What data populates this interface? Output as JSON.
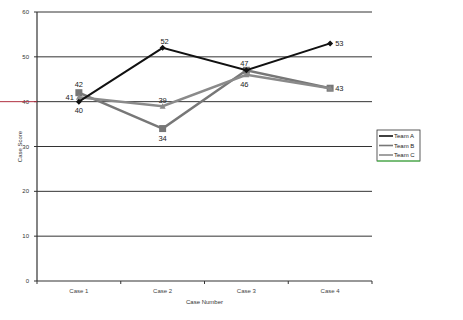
{
  "chart_data": {
    "type": "line",
    "title": "",
    "xlabel": "Case Number",
    "ylabel": "Case Score",
    "categories": [
      "Case 1",
      "Case 2",
      "Case 3",
      "Case 4"
    ],
    "ylim": [
      0,
      60
    ],
    "yticks": [
      0,
      10,
      20,
      30,
      40,
      50,
      60
    ],
    "grid": true,
    "legend_position": "right",
    "series": [
      {
        "name": "Team A",
        "values": [
          40,
          52,
          47,
          53
        ],
        "color": "#111111",
        "marker": "diamond"
      },
      {
        "name": "Team B",
        "values": [
          42,
          34,
          47,
          43
        ],
        "color": "#777777",
        "marker": "square"
      },
      {
        "name": "Team C",
        "values": [
          41,
          39,
          46,
          43
        ],
        "color": "#8a8a8a",
        "marker": "triangle"
      }
    ],
    "data_labels": [
      {
        "series": "Team A",
        "labels": [
          "40",
          "52",
          "47",
          "53"
        ]
      },
      {
        "series": "Team B",
        "labels": [
          "42",
          "34",
          "",
          "43"
        ]
      },
      {
        "series": "Team C",
        "labels": [
          "41",
          "39",
          "46",
          "43"
        ]
      }
    ]
  }
}
